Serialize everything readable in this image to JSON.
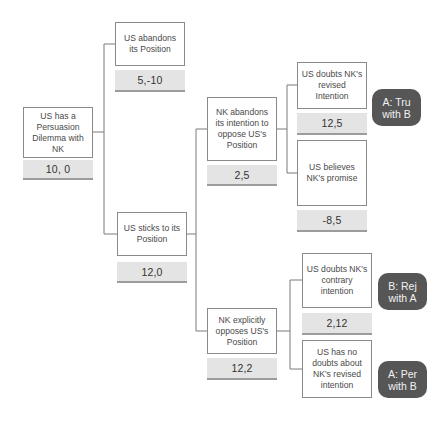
{
  "nodes": {
    "root": {
      "label": "US has a Persuasion Dilemma with NK",
      "payoff": "10, 0"
    },
    "us_abandons": {
      "label": "US abandons its Position",
      "payoff": "5,-10"
    },
    "us_sticks": {
      "label": "US sticks to its Position",
      "payoff": "12,0"
    },
    "nk_abandons": {
      "label": "NK abandons its intention to oppose US's Position",
      "payoff": "2,5"
    },
    "nk_opposes": {
      "label": "NK explicitly opposes US's Position",
      "payoff": "12,2"
    },
    "us_doubts_revised": {
      "label": "US doubts NK's revised Intention",
      "payoff": "12,5"
    },
    "us_believes": {
      "label": "US believes NK's promise",
      "payoff": "-8,5"
    },
    "us_doubts_contrary": {
      "label": "US doubts NK's contrary intention",
      "payoff": "2,12"
    },
    "us_no_doubts": {
      "label": "US has no doubts about NK's revised intention"
    }
  },
  "badges": [
    {
      "id": "a_tru",
      "label": "A: Tru with B"
    },
    {
      "id": "b_rej",
      "label": "B: Rej with A"
    },
    {
      "id": "a_per",
      "label": "A: Per with B"
    }
  ],
  "colors": {
    "badge_bg": "#565656",
    "payoff_bg": "#e4e4e4",
    "line": "#7a7a7a",
    "node_border": "#8a8a8a"
  }
}
